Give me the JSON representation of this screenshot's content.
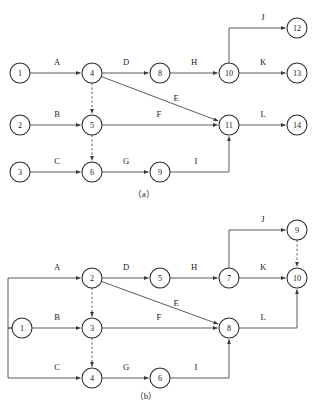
{
  "figure": {
    "background_color": "#ffffff",
    "line_color": "#4a4a4a",
    "node_stroke_color": "#2b2b2b",
    "text_color": "#1a1a1a",
    "node_radius": 10
  },
  "diagrams": [
    {
      "id": "a",
      "caption": "（a）",
      "nodes": [
        {
          "id": "a1",
          "label": "1",
          "cx": 20,
          "cy": 73
        },
        {
          "id": "a2",
          "label": "2",
          "cx": 20,
          "cy": 125
        },
        {
          "id": "a3",
          "label": "3",
          "cx": 20,
          "cy": 172
        },
        {
          "id": "a4",
          "label": "4",
          "cx": 92,
          "cy": 73
        },
        {
          "id": "a5",
          "label": "5",
          "cx": 92,
          "cy": 125
        },
        {
          "id": "a6",
          "label": "6",
          "cx": 92,
          "cy": 172
        },
        {
          "id": "a8",
          "label": "8",
          "cx": 160,
          "cy": 73
        },
        {
          "id": "a9",
          "label": "9",
          "cx": 160,
          "cy": 172
        },
        {
          "id": "a10",
          "label": "10",
          "cx": 229,
          "cy": 73
        },
        {
          "id": "a11",
          "label": "11",
          "cx": 229,
          "cy": 125
        },
        {
          "id": "a12",
          "label": "12",
          "cx": 297,
          "cy": 28
        },
        {
          "id": "a13",
          "label": "13",
          "cx": 297,
          "cy": 73
        },
        {
          "id": "a14",
          "label": "14",
          "cx": 297,
          "cy": 125
        }
      ],
      "edges": [
        {
          "label": "A",
          "from": "a1",
          "to": "a4",
          "style": "solid",
          "label_x": 57,
          "label_y": 62
        },
        {
          "label": "B",
          "from": "a2",
          "to": "a5",
          "style": "solid",
          "label_x": 57,
          "label_y": 114
        },
        {
          "label": "C",
          "from": "a3",
          "to": "a6",
          "style": "solid",
          "label_x": 57,
          "label_y": 161
        },
        {
          "label": "D",
          "from": "a4",
          "to": "a8",
          "style": "solid",
          "label_x": 126,
          "label_y": 62
        },
        {
          "label": "E",
          "from": "a4",
          "to": "a11",
          "style": "solid",
          "label_x": 176,
          "label_y": 98
        },
        {
          "label": "F",
          "from": "a5",
          "to": "a11",
          "style": "solid",
          "label_x": 159,
          "label_y": 114
        },
        {
          "label": "G",
          "from": "a6",
          "to": "a9",
          "style": "solid",
          "label_x": 126,
          "label_y": 161
        },
        {
          "label": "H",
          "from": "a8",
          "to": "a10",
          "style": "solid",
          "label_x": 194,
          "label_y": 62
        },
        {
          "label": "I",
          "from": "a9",
          "to": "a11",
          "style": "solid",
          "label_x": 196,
          "label_y": 161
        },
        {
          "label": "J",
          "from": "a10",
          "to": "a12",
          "style": "solid",
          "label_x": 263,
          "label_y": 17
        },
        {
          "label": "K",
          "from": "a10",
          "to": "a13",
          "style": "solid",
          "label_x": 263,
          "label_y": 62
        },
        {
          "label": "L",
          "from": "a11",
          "to": "a14",
          "style": "solid",
          "label_x": 263,
          "label_y": 114
        },
        {
          "label": "",
          "from": "a4",
          "to": "a5",
          "style": "dashed",
          "label_x": 0,
          "label_y": 0
        },
        {
          "label": "",
          "from": "a5",
          "to": "a6",
          "style": "dashed",
          "label_x": 0,
          "label_y": 0
        }
      ]
    },
    {
      "id": "b",
      "caption": "（b）",
      "nodes": [
        {
          "id": "b1",
          "label": "1",
          "cx": 22,
          "cy": 328
        },
        {
          "id": "b2",
          "label": "2",
          "cx": 92,
          "cy": 278
        },
        {
          "id": "b3",
          "label": "3",
          "cx": 92,
          "cy": 328
        },
        {
          "id": "b4",
          "label": "4",
          "cx": 92,
          "cy": 378
        },
        {
          "id": "b5",
          "label": "5",
          "cx": 160,
          "cy": 278
        },
        {
          "id": "b6",
          "label": "6",
          "cx": 160,
          "cy": 378
        },
        {
          "id": "b7",
          "label": "7",
          "cx": 229,
          "cy": 278
        },
        {
          "id": "b8",
          "label": "8",
          "cx": 229,
          "cy": 328
        },
        {
          "id": "b9",
          "label": "9",
          "cx": 297,
          "cy": 230
        },
        {
          "id": "b10",
          "label": "10",
          "cx": 297,
          "cy": 278
        }
      ],
      "edges": [
        {
          "label": "A",
          "from": "b1",
          "to": "b2",
          "style": "solid",
          "label_x": 57,
          "label_y": 267
        },
        {
          "label": "B",
          "from": "b1",
          "to": "b3",
          "style": "solid",
          "label_x": 57,
          "label_y": 317
        },
        {
          "label": "C",
          "from": "b1",
          "to": "b4",
          "style": "solid",
          "label_x": 57,
          "label_y": 367
        },
        {
          "label": "D",
          "from": "b2",
          "to": "b5",
          "style": "solid",
          "label_x": 126,
          "label_y": 267
        },
        {
          "label": "E",
          "from": "b2",
          "to": "b8",
          "style": "solid",
          "label_x": 176,
          "label_y": 303
        },
        {
          "label": "F",
          "from": "b3",
          "to": "b8",
          "style": "solid",
          "label_x": 159,
          "label_y": 317
        },
        {
          "label": "G",
          "from": "b4",
          "to": "b6",
          "style": "solid",
          "label_x": 126,
          "label_y": 367
        },
        {
          "label": "H",
          "from": "b5",
          "to": "b7",
          "style": "solid",
          "label_x": 194,
          "label_y": 267
        },
        {
          "label": "I",
          "from": "b6",
          "to": "b8",
          "style": "solid",
          "label_x": 196,
          "label_y": 367
        },
        {
          "label": "J",
          "from": "b7",
          "to": "b9",
          "style": "solid",
          "label_x": 263,
          "label_y": 219
        },
        {
          "label": "K",
          "from": "b7",
          "to": "b10",
          "style": "solid",
          "label_x": 263,
          "label_y": 267
        },
        {
          "label": "L",
          "from": "b8",
          "to": "b10",
          "style": "solid",
          "label_x": 263,
          "label_y": 317
        },
        {
          "label": "",
          "from": "b2",
          "to": "b3",
          "style": "dashed",
          "label_x": 0,
          "label_y": 0
        },
        {
          "label": "",
          "from": "b3",
          "to": "b4",
          "style": "dashed",
          "label_x": 0,
          "label_y": 0
        },
        {
          "label": "",
          "from": "b9",
          "to": "b10",
          "style": "dashed",
          "label_x": 0,
          "label_y": 0
        }
      ]
    }
  ],
  "captions": [
    {
      "text": "（a）",
      "x": 144,
      "y": 194
    },
    {
      "text": "（b）",
      "x": 146,
      "y": 396
    }
  ]
}
